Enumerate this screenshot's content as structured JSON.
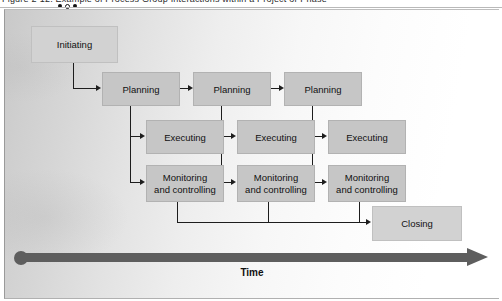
{
  "caption": {
    "text": "Figure 2-12. Example of Process Group Interactions within a Project or Phase",
    "dots": [
      "filled",
      "hollow",
      "filled"
    ]
  },
  "diagram": {
    "time_axis": {
      "label": "Time",
      "direction": "left-to-right"
    },
    "nodes": {
      "initiating": "Initiating",
      "closing": "Closing",
      "planning": [
        "Planning",
        "Planning",
        "Planning"
      ],
      "executing": [
        "Executing",
        "Executing",
        "Executing"
      ],
      "monitoring": [
        "Monitoring and controlling",
        "Monitoring and controlling",
        "Monitoring and controlling"
      ],
      "monitoring_lines": [
        [
          "Monitoring",
          "and controlling"
        ],
        [
          "Monitoring",
          "and controlling"
        ],
        [
          "Monitoring",
          "and controlling"
        ]
      ]
    },
    "colors": {
      "box_fill": "#c6c6c6",
      "box_fill_light": "#d2d2d2",
      "box_border": "#b2b2b2",
      "connector": "#1d1d1d",
      "time_arrow": "#5e5e5e",
      "text": "#111111"
    }
  }
}
